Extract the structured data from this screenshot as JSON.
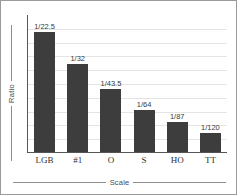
{
  "chart_data": {
    "type": "bar",
    "title": "",
    "xlabel": "Scale",
    "ylabel": "Ratio",
    "categories": [
      "LGB",
      "#1",
      "O",
      "S",
      "HO",
      "TT"
    ],
    "value_labels": [
      "1/22.5",
      "1/32",
      "1/43.5",
      "1/64",
      "1/87",
      "1/120"
    ],
    "values": [
      22.5,
      32,
      43.5,
      64,
      87,
      120
    ],
    "bar_fractions": [
      1.0,
      0.733,
      0.525,
      0.35,
      0.25,
      0.158
    ],
    "grid": true,
    "gridlines": 9,
    "legend": "none",
    "ylim": [
      0,
      1
    ],
    "ytick_labels": [],
    "colors": {
      "bar": "#3d3d3d",
      "axis": "#555555",
      "grid": "#e4e4e4",
      "label": "#4a4a4a",
      "frame": "#9a9a9a",
      "background": "#ffffff"
    }
  }
}
